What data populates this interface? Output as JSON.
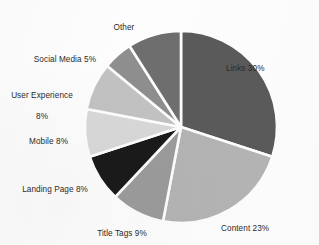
{
  "chart_data": {
    "type": "pie",
    "title": "",
    "subtitle": "",
    "xlabel": "",
    "ylabel": "",
    "legend_position": "none",
    "grid": false,
    "label_format": "name + percent",
    "start_angle_deg": 0,
    "direction": "clockwise",
    "categories": [
      "Links",
      "Content",
      "Title Tags",
      "Landing Page",
      "Mobile",
      "User Experience",
      "Social Media",
      "Other"
    ],
    "values": [
      30,
      23,
      9,
      8,
      8,
      8,
      5,
      9
    ],
    "units": "%",
    "slices": [
      {
        "name": "Links",
        "value": 30,
        "label": "Links 30%",
        "color": "#5a5a5a",
        "label_position": "right",
        "label_line1": "Links 30%",
        "label_line2": ""
      },
      {
        "name": "Content",
        "value": 23,
        "label": "Content 23%",
        "color": "#b4b4b4",
        "label_position": "bottom-right",
        "label_line1": "Content 23%",
        "label_line2": ""
      },
      {
        "name": "Title Tags",
        "value": 9,
        "label": "Title Tags 9%",
        "color": "#9b9b9b",
        "label_position": "bottom",
        "label_line1": "Title Tags 9%",
        "label_line2": ""
      },
      {
        "name": "Landing Page",
        "value": 8,
        "label": "Landing Page 8%",
        "color": "#1a1a1a",
        "label_position": "bottom-left",
        "label_line1": "Landing Page 8%",
        "label_line2": ""
      },
      {
        "name": "Mobile",
        "value": 8,
        "label": "Mobile 8%",
        "color": "#d8d8d8",
        "label_position": "left",
        "label_line1": "Mobile 8%",
        "label_line2": ""
      },
      {
        "name": "User Experience",
        "value": 8,
        "label": "User Experience 8%",
        "color": "#c2c2c2",
        "label_position": "upper-left",
        "label_line1": "User Experience",
        "label_line2": "8%"
      },
      {
        "name": "Social Media",
        "value": 5,
        "label": "Social Media 5%",
        "color": "#8e8e8e",
        "label_position": "upper-left",
        "label_line1": "Social Media 5%",
        "label_line2": ""
      },
      {
        "name": "Other",
        "value": 9,
        "label": "Other",
        "color": "#6e6e6e",
        "label_position": "top",
        "label_line1": "Other",
        "label_line2": ""
      }
    ],
    "geometry": {
      "center_x": 181,
      "center_y": 127,
      "radius": 96,
      "separator_color": "#fdfdfd",
      "separator_width": 2.6
    },
    "background_color": "#fdfdfd",
    "text_color": "#2b2b2b"
  }
}
